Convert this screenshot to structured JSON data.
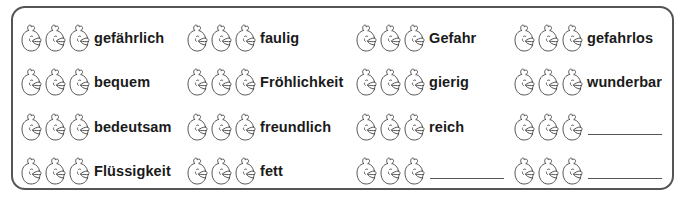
{
  "worksheet": {
    "columns_x": [
      20,
      186,
      355,
      513
    ],
    "rows_y": [
      21,
      65,
      110,
      154
    ],
    "chick_count_per_item": 3,
    "colors": {
      "border": "#555555",
      "text": "#1a1a1a",
      "icon_stroke": "#444444"
    },
    "items": [
      {
        "row": 0,
        "col": 0,
        "word": "gefährlich",
        "blank": false
      },
      {
        "row": 0,
        "col": 1,
        "word": "faulig",
        "blank": false
      },
      {
        "row": 0,
        "col": 2,
        "word": "Gefahr",
        "blank": false
      },
      {
        "row": 0,
        "col": 3,
        "word": "gefahrlos",
        "blank": false
      },
      {
        "row": 1,
        "col": 0,
        "word": "bequem",
        "blank": false
      },
      {
        "row": 1,
        "col": 1,
        "word": "Fröhlichkeit",
        "blank": false
      },
      {
        "row": 1,
        "col": 2,
        "word": "gierig",
        "blank": false
      },
      {
        "row": 1,
        "col": 3,
        "word": "wunderbar",
        "blank": false
      },
      {
        "row": 2,
        "col": 0,
        "word": "bedeutsam",
        "blank": false
      },
      {
        "row": 2,
        "col": 1,
        "word": "freundlich",
        "blank": false
      },
      {
        "row": 2,
        "col": 2,
        "word": "reich",
        "blank": false
      },
      {
        "row": 2,
        "col": 3,
        "word": "",
        "blank": true
      },
      {
        "row": 3,
        "col": 0,
        "word": "Flüssigkeit",
        "blank": false
      },
      {
        "row": 3,
        "col": 1,
        "word": "fett",
        "blank": false
      },
      {
        "row": 3,
        "col": 2,
        "word": "",
        "blank": true
      },
      {
        "row": 3,
        "col": 3,
        "word": "",
        "blank": true
      }
    ],
    "icon": "chick-head-icon"
  }
}
